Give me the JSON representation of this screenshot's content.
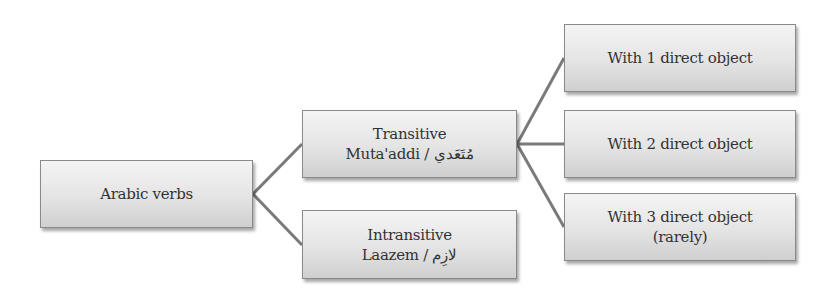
{
  "diagram": {
    "type": "tree",
    "root": {
      "label": "Arabic verbs"
    },
    "level1": [
      {
        "line1": "Transitive",
        "line2": "Muta'addi / مُتَعَدي"
      },
      {
        "line1": "Intransitive",
        "line2": "Laazem / لازِم"
      }
    ],
    "level2": [
      {
        "line1": "With 1 direct object"
      },
      {
        "line1": "With 2 direct object"
      },
      {
        "line1": "With 3 direct object",
        "line2": "(rarely)"
      }
    ],
    "edges": [
      [
        "Arabic verbs",
        "Transitive"
      ],
      [
        "Arabic verbs",
        "Intransitive"
      ],
      [
        "Transitive",
        "With 1 direct object"
      ],
      [
        "Transitive",
        "With 2 direct object"
      ],
      [
        "Transitive",
        "With 3 direct object"
      ]
    ],
    "colors": {
      "box_top": "#f4f4f4",
      "box_bottom": "#cfcfcf",
      "border": "#8a8a8a",
      "connector": "#7a7a7a",
      "text": "#333333"
    }
  }
}
